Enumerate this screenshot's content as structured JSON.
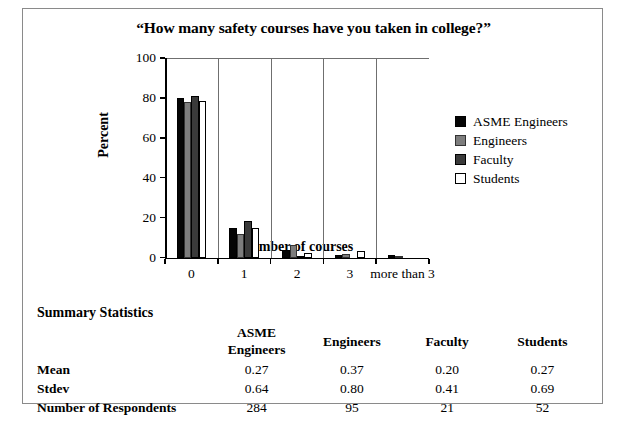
{
  "chart_data": {
    "type": "bar",
    "title": "“How many safety courses have you taken in college?”",
    "xlabel": "Number of courses",
    "ylabel": "Percent",
    "categories": [
      "0",
      "1",
      "2",
      "3",
      "more than 3"
    ],
    "ylim": [
      0,
      100
    ],
    "yticks": [
      0,
      20,
      40,
      60,
      80,
      100
    ],
    "grid": "vertical-category-separators",
    "legend_position": "right",
    "series": [
      {
        "name": "ASME Engineers",
        "color": "#050505",
        "values": [
          80,
          15,
          4,
          1.5,
          1.5
        ]
      },
      {
        "name": "Engineers",
        "color": "#7d7d7d",
        "values": [
          78,
          12,
          6.5,
          2,
          1
        ]
      },
      {
        "name": "Faculty",
        "color": "#3a3a3a",
        "values": [
          81,
          18.5,
          1,
          0,
          0
        ]
      },
      {
        "name": "Students",
        "color": "#ffffff",
        "values": [
          78.5,
          15,
          2.5,
          3.5,
          0
        ]
      }
    ]
  },
  "legend": {
    "items": [
      {
        "label": "ASME Engineers",
        "swatch": "s0"
      },
      {
        "label": "Engineers",
        "swatch": "s1"
      },
      {
        "label": "Faculty",
        "swatch": "s2"
      },
      {
        "label": "Students",
        "swatch": "s3"
      }
    ]
  },
  "summary": {
    "title": "Summary Statistics",
    "columns": [
      "ASME Engineers",
      "Engineers",
      "Faculty",
      "Students"
    ],
    "rows": [
      {
        "label": "Mean",
        "values": [
          "0.27",
          "0.37",
          "0.20",
          "0.27"
        ]
      },
      {
        "label": "Stdev",
        "values": [
          "0.64",
          "0.80",
          "0.41",
          "0.69"
        ]
      },
      {
        "label": "Number of Respondents",
        "values": [
          "284",
          "95",
          "21",
          "52"
        ]
      }
    ]
  }
}
